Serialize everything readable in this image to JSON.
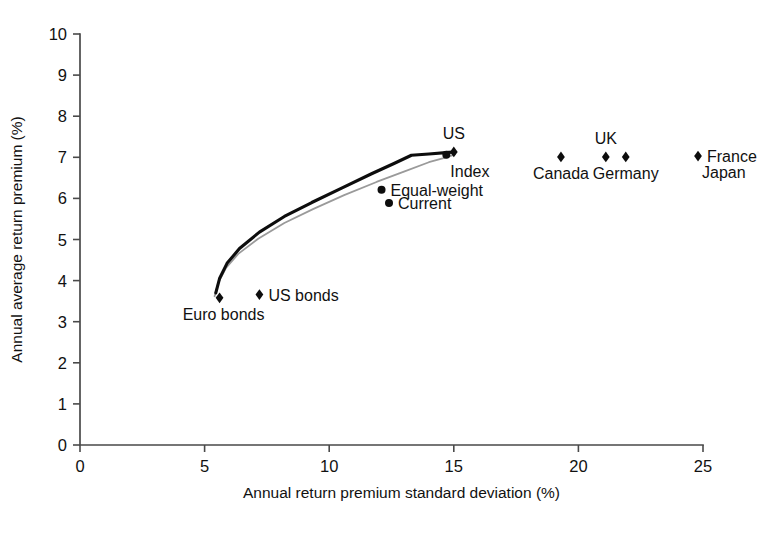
{
  "chart_data": {
    "type": "scatter",
    "title": "",
    "xlabel": "Annual return premium standard deviation (%)",
    "ylabel": "Annual average return premium (%)",
    "xlim": [
      0,
      25
    ],
    "ylim": [
      0,
      10
    ],
    "xticks": [
      "0",
      "5",
      "10",
      "15",
      "20",
      "25"
    ],
    "xtick_values": [
      0,
      5,
      10,
      15,
      20,
      25
    ],
    "yticks": [
      "0",
      "1",
      "2",
      "3",
      "4",
      "5",
      "6",
      "7",
      "8",
      "9",
      "10"
    ],
    "ytick_values": [
      0,
      1,
      2,
      3,
      4,
      5,
      6,
      7,
      8,
      9,
      10
    ],
    "grid": false,
    "legend_position": "none",
    "points": [
      {
        "label": "Euro bonds",
        "x": 5.6,
        "y": 3.58,
        "marker": "diamond",
        "label_pos": "below-left"
      },
      {
        "label": "US bonds",
        "x": 7.2,
        "y": 3.66,
        "marker": "diamond",
        "label_pos": "right"
      },
      {
        "label": "Equal-weight",
        "x": 12.1,
        "y": 6.21,
        "marker": "dot",
        "label_pos": "right"
      },
      {
        "label": "Current",
        "x": 12.4,
        "y": 5.89,
        "marker": "dot",
        "label_pos": "right"
      },
      {
        "label": "Index",
        "x": 14.7,
        "y": 7.06,
        "marker": "dot",
        "label_pos": "below-right"
      },
      {
        "label": "US",
        "x": 15.0,
        "y": 7.13,
        "marker": "diamond",
        "label_pos": "above"
      },
      {
        "label": "Canada",
        "x": 19.3,
        "y": 7.01,
        "marker": "diamond",
        "label_pos": "below"
      },
      {
        "label": "UK",
        "x": 21.1,
        "y": 7.01,
        "marker": "diamond",
        "label_pos": "above"
      },
      {
        "label": "Germany",
        "x": 21.9,
        "y": 7.01,
        "marker": "diamond",
        "label_pos": "below"
      },
      {
        "label": "France",
        "x": 24.8,
        "y": 7.03,
        "marker": "diamond",
        "label_pos": "right"
      },
      {
        "label": "Japan",
        "x": 24.8,
        "y": 7.03,
        "marker": "none",
        "label_pos": "below-right"
      }
    ],
    "series": [
      {
        "name": "efficient-frontier-upper",
        "style": "thick black line",
        "points": [
          [
            5.45,
            3.7
          ],
          [
            5.6,
            4.05
          ],
          [
            5.9,
            4.42
          ],
          [
            6.4,
            4.78
          ],
          [
            7.2,
            5.18
          ],
          [
            8.2,
            5.56
          ],
          [
            9.3,
            5.9
          ],
          [
            10.5,
            6.25
          ],
          [
            11.7,
            6.6
          ],
          [
            12.6,
            6.85
          ],
          [
            13.3,
            7.05
          ],
          [
            14.0,
            7.08
          ],
          [
            14.8,
            7.12
          ],
          [
            15.05,
            7.13
          ]
        ]
      },
      {
        "name": "efficient-frontier-lower",
        "style": "thin gray line",
        "points": [
          [
            5.4,
            3.62
          ],
          [
            5.55,
            3.95
          ],
          [
            5.85,
            4.3
          ],
          [
            6.35,
            4.65
          ],
          [
            7.15,
            5.02
          ],
          [
            8.2,
            5.4
          ],
          [
            9.35,
            5.74
          ],
          [
            10.6,
            6.08
          ],
          [
            11.9,
            6.4
          ],
          [
            13.0,
            6.65
          ],
          [
            14.0,
            6.88
          ],
          [
            14.7,
            7.0
          ],
          [
            15.05,
            7.07
          ]
        ]
      }
    ]
  }
}
